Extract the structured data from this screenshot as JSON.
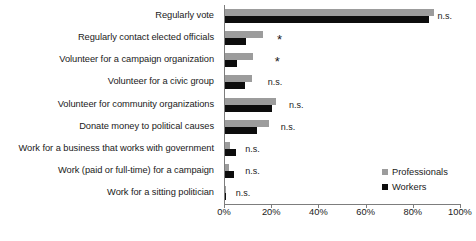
{
  "chart_data": {
    "type": "bar",
    "orientation": "horizontal",
    "title": "",
    "subtitle": "",
    "xlabel": "",
    "ylabel": "",
    "xlim": [
      0,
      100
    ],
    "grid": false,
    "legend_position": "inside-bottom-right",
    "xticks": [
      "0%",
      "20%",
      "40%",
      "60%",
      "80%",
      "100%"
    ],
    "xtick_values": [
      0,
      20,
      40,
      60,
      80,
      100
    ],
    "categories": [
      "Regularly vote",
      "Regularly contact elected officials",
      "Volunteer for a campaign organization",
      "Volunteer for a civic group",
      "Volunteer for community organizations",
      "Donate money to political causes",
      "Work for a business that works with government",
      "Work (paid or full-time) for a campaign",
      "Work for a sitting politician"
    ],
    "series": [
      {
        "name": "Professionals",
        "color": "#9c9c9c",
        "values": [
          88.5,
          16.0,
          12.0,
          11.5,
          21.5,
          18.5,
          2.0,
          1.5,
          0.3
        ]
      },
      {
        "name": "Workers",
        "color": "#0d0d0d",
        "values": [
          86.5,
          9.0,
          5.0,
          8.5,
          20.0,
          13.5,
          4.5,
          4.0,
          0.2
        ]
      }
    ],
    "annotations": [
      {
        "category": "Regularly vote",
        "text": "n.s.",
        "kind": "ns",
        "x": 90.5
      },
      {
        "category": "Regularly contact elected officials",
        "text": "*",
        "kind": "star",
        "x": 22.5
      },
      {
        "category": "Volunteer for a campaign organization",
        "text": "*",
        "kind": "star",
        "x": 21.5
      },
      {
        "category": "Volunteer for a civic group",
        "text": "n.s.",
        "kind": "ns",
        "x": 18.5
      },
      {
        "category": "Volunteer for community organizations",
        "text": "n.s.",
        "kind": "ns",
        "x": 27.5
      },
      {
        "category": "Donate money to political causes",
        "text": "n.s.",
        "kind": "ns",
        "x": 24.0
      },
      {
        "category": "Work for a business that works with government",
        "text": "n.s.",
        "kind": "ns",
        "x": 9.0
      },
      {
        "category": "Work (paid or full-time) for a campaign",
        "text": "n.s.",
        "kind": "ns",
        "x": 9.0
      },
      {
        "category": "Work for a sitting politician",
        "text": "n.s.",
        "kind": "ns",
        "x": 5.0
      }
    ]
  },
  "legend": {
    "items": [
      {
        "label": "Professionals",
        "color": "#9c9c9c"
      },
      {
        "label": "Workers",
        "color": "#0d0d0d"
      }
    ]
  },
  "axis": {
    "tick_labels": [
      "0%",
      "20%",
      "40%",
      "60%",
      "80%",
      "100%"
    ]
  }
}
